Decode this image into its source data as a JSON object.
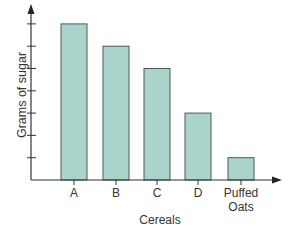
{
  "chart_data": {
    "type": "bar",
    "title": "",
    "xlabel": "Cereals",
    "ylabel": "Grams of sugar",
    "categories": [
      "A",
      "B",
      "C",
      "D",
      "Puffed Oats"
    ],
    "values": [
      7,
      6,
      5,
      3,
      1
    ],
    "ylim": [
      0,
      7.5
    ],
    "y_ticks_unlabeled": [
      1,
      2,
      3,
      4,
      5,
      6,
      7
    ],
    "grid": false,
    "bar_color": "#a9d3cb",
    "bar_edge_color": "#4a5a57",
    "axis_color": "#333333"
  },
  "labels": {
    "x_axis": "Cereals",
    "y_axis": "Grams of sugar",
    "cat_a": "A",
    "cat_b": "B",
    "cat_c": "C",
    "cat_d": "D",
    "cat_e_line1": "Puffed",
    "cat_e_line2": "Oats"
  }
}
